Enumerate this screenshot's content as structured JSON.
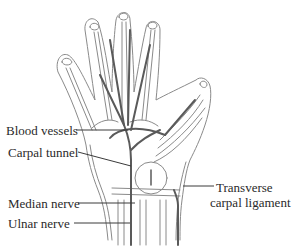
{
  "figure": {
    "colors": {
      "outline": "#8a8a8a",
      "vessel": "#5a5a5a",
      "text": "#2a2a2a",
      "background": "#ffffff"
    }
  },
  "labels": [
    {
      "id": "blood-vessels",
      "text": "Blood vessels"
    },
    {
      "id": "carpal-tunnel",
      "text": "Carpal tunnel"
    },
    {
      "id": "median-nerve",
      "text": "Median nerve"
    },
    {
      "id": "ulnar-nerve",
      "text": "Ulnar nerve"
    },
    {
      "id": "transverse-carpal-ligament-line1",
      "text": "Transverse"
    },
    {
      "id": "transverse-carpal-ligament-line2",
      "text": "carpal ligament"
    }
  ]
}
